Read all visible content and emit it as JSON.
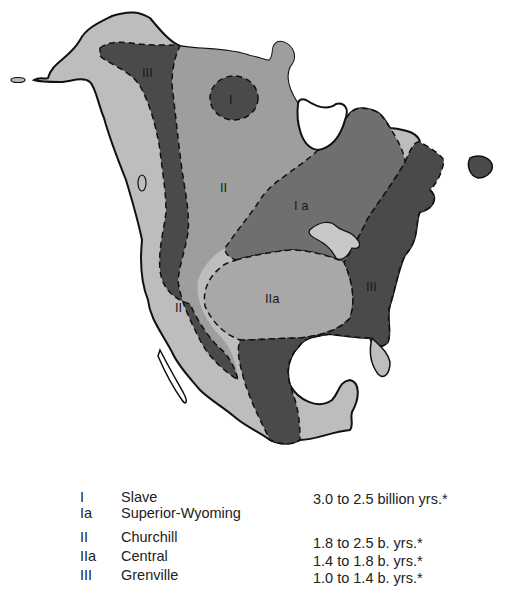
{
  "map": {
    "colors": {
      "outer_margin": "#bdbdbd",
      "province_II": "#9e9e9e",
      "province_Ia": "#6f6f6f",
      "province_III": "#4a4a4a",
      "province_I": "#4a4a4a",
      "province_IIa": "#a8a8a8",
      "outline": "#111111"
    },
    "labels": [
      {
        "id": "I",
        "text": "I",
        "x": 233,
        "y": 100
      },
      {
        "id": "III-west",
        "text": "III",
        "x": 142,
        "y": 75
      },
      {
        "id": "II-north",
        "text": "II",
        "x": 223,
        "y": 187
      },
      {
        "id": "Ia",
        "text": "I a",
        "x": 300,
        "y": 206
      },
      {
        "id": "IIa",
        "text": "IIa",
        "x": 265,
        "y": 298
      },
      {
        "id": "II-south",
        "text": "II",
        "x": 177,
        "y": 310
      },
      {
        "id": "III-east",
        "text": "III",
        "x": 367,
        "y": 287
      }
    ]
  },
  "legend": {
    "rows": [
      {
        "code": "I",
        "name": "Slave",
        "age": "3.0 to 2.5 billion yrs.*"
      },
      {
        "code": "Ia",
        "name": "Superior-Wyoming",
        "age": ""
      },
      {
        "code": "II",
        "name": "Churchill",
        "age": "1.8 to 2.5 b. yrs.*"
      },
      {
        "code": "IIa",
        "name": "Central",
        "age": "1.4 to 1.8 b. yrs.*"
      },
      {
        "code": "III",
        "name": "Grenville",
        "age": "1.0 to 1.4 b. yrs.*"
      }
    ]
  }
}
